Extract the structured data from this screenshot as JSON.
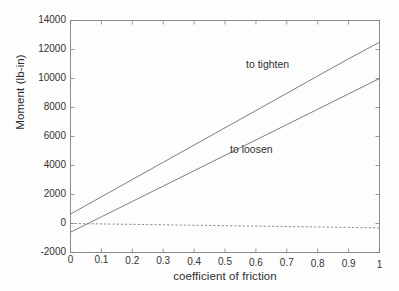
{
  "figure": {
    "background_color": "#fdfdfd",
    "axis_color": "#808080",
    "line_color": "#6e6e6e",
    "text_color": "#2f2f2f"
  },
  "chart_data": {
    "type": "line",
    "title": "",
    "xlabel": "coefficient of friction",
    "ylabel": "Moment (lb-in)",
    "xlim": [
      0,
      1
    ],
    "ylim": [
      -2000,
      14000
    ],
    "xticks": [
      0,
      0.1,
      0.2,
      0.3,
      0.4,
      0.5,
      0.6,
      0.7,
      0.8,
      0.9,
      1
    ],
    "xticklabels": [
      "0",
      "0.1",
      "0.2",
      "0.3",
      "0.4",
      "0.5",
      "0.6",
      "0.7",
      "0.8",
      "0.9",
      "1"
    ],
    "yticks": [
      -2000,
      0,
      2000,
      4000,
      6000,
      8000,
      10000,
      12000,
      14000
    ],
    "yticklabels": [
      "-2000",
      "0",
      "2000",
      "4000",
      "6000",
      "8000",
      "10000",
      "12000",
      "14000"
    ],
    "grid": false,
    "legend": "none",
    "box": true,
    "tick_direction": "in",
    "series": [
      {
        "name": "to tighten",
        "style": "solid",
        "annotation": "to tighten",
        "annotation_x": 0.58,
        "annotation_y": 11000,
        "x": [
          0,
          0.1,
          0.2,
          0.3,
          0.4,
          0.5,
          0.6,
          0.7,
          0.8,
          0.9,
          1
        ],
        "values": [
          650,
          1840,
          3030,
          4220,
          5410,
          6600,
          7790,
          8980,
          10170,
          11360,
          12500
        ]
      },
      {
        "name": "to loosen",
        "style": "solid",
        "annotation": "to loosen",
        "annotation_x": 0.52,
        "annotation_y": 5200,
        "x": [
          0,
          0.1,
          0.2,
          0.3,
          0.4,
          0.5,
          0.6,
          0.7,
          0.8,
          0.9,
          1
        ],
        "values": [
          -600,
          460,
          1520,
          2580,
          3640,
          4700,
          5760,
          6820,
          7880,
          8940,
          10000
        ]
      },
      {
        "name": "zero reference",
        "style": "dashed",
        "annotation": "",
        "x": [
          0,
          1
        ],
        "values": [
          0,
          -300
        ]
      }
    ]
  }
}
